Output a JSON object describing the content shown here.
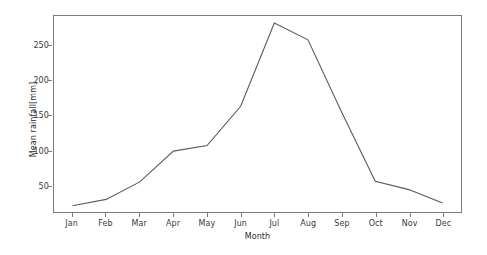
{
  "chart_data": {
    "type": "line",
    "title": "",
    "xlabel": "Month",
    "ylabel": "Mean rainfall[mm]",
    "categories": [
      "Jan",
      "Feb",
      "Mar",
      "Apr",
      "May",
      "Jun",
      "Jul",
      "Aug",
      "Sep",
      "Oct",
      "Nov",
      "Dec"
    ],
    "values": [
      21,
      30,
      55,
      99,
      107,
      163,
      282,
      258,
      155,
      56,
      44,
      25
    ],
    "series": [
      {
        "name": "Mean rainfall",
        "values": [
          21,
          30,
          55,
          99,
          107,
          163,
          282,
          258,
          155,
          56,
          44,
          25
        ]
      }
    ],
    "yticks": [
      50,
      100,
      150,
      200,
      250
    ],
    "ytick_labels": [
      "50",
      "100",
      "150",
      "200",
      "250"
    ],
    "ylim": [
      12,
      292
    ],
    "xlim": [
      -0.55,
      11.55
    ],
    "grid": false,
    "legend": false,
    "line_color": "#5a5a5a",
    "line_width": 1.1,
    "frame_color": "#7a7a7a",
    "background": "#ffffff"
  },
  "axes": {
    "x_label": "Month",
    "y_label": "Mean rainfall[mm]"
  }
}
